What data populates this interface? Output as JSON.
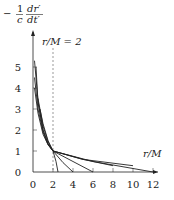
{
  "chart_data": {
    "type": "line",
    "title": "",
    "ylabel": "-(1/c) dr'/dt'",
    "ylabel_parts": {
      "minus": "−",
      "num": "1",
      "den": "c",
      "dnum": "dr′",
      "dden": "dt′"
    },
    "xlabel": "r/M",
    "annotation": "r/M = 2",
    "xlim": [
      0,
      12
    ],
    "ylim": [
      0,
      5.5
    ],
    "x_ticks": [
      "0",
      "2",
      "4",
      "6",
      "8",
      "10",
      "12"
    ],
    "y_ticks": [
      "0",
      "1",
      "2",
      "3",
      "4",
      "5"
    ],
    "grid": false,
    "reference_line": {
      "x": 2,
      "style": "dashed"
    },
    "series": [
      {
        "name": "curve-a",
        "x": [
          0.15,
          0.5,
          1,
          1.5,
          2,
          2.3,
          2.5
        ],
        "y": [
          5.3,
          3.4,
          2.0,
          1.35,
          1.0,
          0.5,
          0
        ]
      },
      {
        "name": "curve-b",
        "x": [
          0.15,
          0.5,
          1,
          1.5,
          2,
          3,
          4
        ],
        "y": [
          4.5,
          3.0,
          1.9,
          1.3,
          1.0,
          0.45,
          0
        ]
      },
      {
        "name": "curve-c",
        "x": [
          0.15,
          0.5,
          1,
          1.5,
          2,
          4,
          6
        ],
        "y": [
          4.0,
          2.8,
          1.8,
          1.3,
          1.0,
          0.5,
          0
        ]
      },
      {
        "name": "curve-d",
        "x": [
          0.3,
          0.5,
          1,
          1.5,
          2,
          5,
          8
        ],
        "y": [
          5.0,
          3.3,
          2.0,
          1.35,
          1.0,
          0.6,
          0.3
        ]
      },
      {
        "name": "curve-e",
        "x": [
          0.5,
          1,
          1.5,
          2,
          5,
          10
        ],
        "y": [
          3.5,
          2.2,
          1.45,
          1.0,
          0.6,
          0.3
        ]
      },
      {
        "name": "curve-f",
        "x": [
          0.7,
          1,
          1.5,
          2,
          6,
          12
        ],
        "y": [
          3.0,
          2.3,
          1.5,
          1.0,
          0.5,
          0
        ]
      }
    ]
  }
}
